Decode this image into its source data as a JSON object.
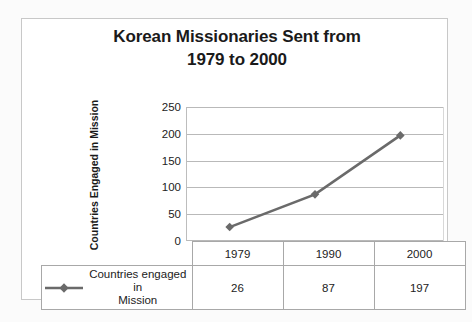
{
  "chart_data": {
    "type": "line",
    "title": "Korean Missionaries Sent from 1979 to 2000",
    "title_line1": "Korean Missionaries Sent from",
    "title_line2": "1979 to 2000",
    "xlabel": "",
    "ylabel": "Countries Engaged in Mission",
    "categories": [
      "1979",
      "1990",
      "2000"
    ],
    "values": [
      26,
      87,
      197
    ],
    "series": [
      {
        "name": "Countries engaged in Mission",
        "values": [
          26,
          87,
          197
        ]
      }
    ],
    "ylim": [
      0,
      250
    ],
    "yticks": [
      "0",
      "50",
      "100",
      "150",
      "200",
      "250"
    ],
    "ytick_values": [
      0,
      50,
      100,
      150,
      200,
      250
    ],
    "grid": "horizontal",
    "legend_position": "table-left",
    "line_color": "#6a6a6a",
    "marker": "diamond",
    "gridline_color": "#b9b9b9"
  },
  "table": {
    "legend_label_line1": "Countries engaged in",
    "legend_label_line2": "Mission",
    "header": [
      "1979",
      "1990",
      "2000"
    ],
    "row": [
      "26",
      "87",
      "197"
    ]
  }
}
